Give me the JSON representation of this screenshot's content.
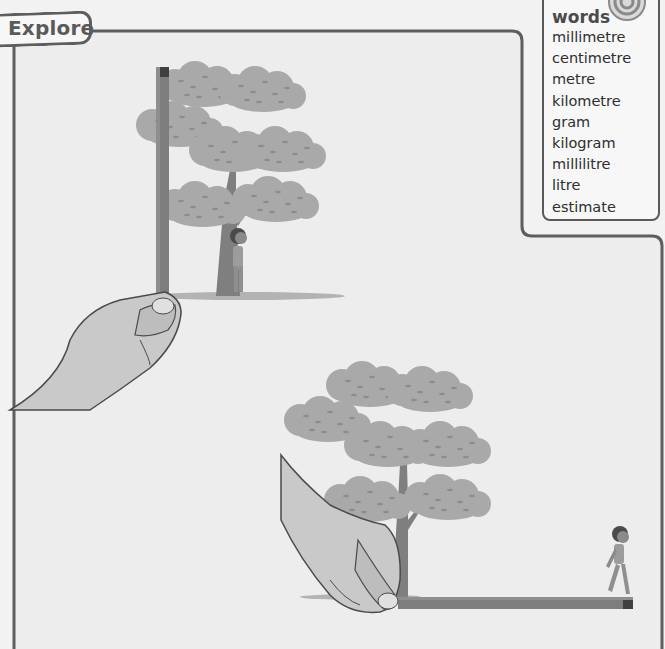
{
  "section": {
    "tab_label": "Explore"
  },
  "key_words": {
    "title": "words",
    "icon": "target-icon",
    "items": [
      "millimetre",
      "centimetre",
      "metre",
      "kilometre",
      "gram",
      "kilogram",
      "millilitre",
      "litre",
      "estimate"
    ]
  },
  "illustrations": [
    {
      "id": "vertical-estimate",
      "description": "Hand holding a pencil vertically beside a tree with a child standing under it"
    },
    {
      "id": "horizontal-estimate",
      "description": "Hand holding a pencil horizontally along the ground from a tree to a walking child"
    }
  ],
  "colors": {
    "background": "#f2f2f2",
    "border": "#5e5e5e",
    "pencil": "#7d7d7d",
    "foliage": "#a8a8a8",
    "trunk": "#808080"
  }
}
